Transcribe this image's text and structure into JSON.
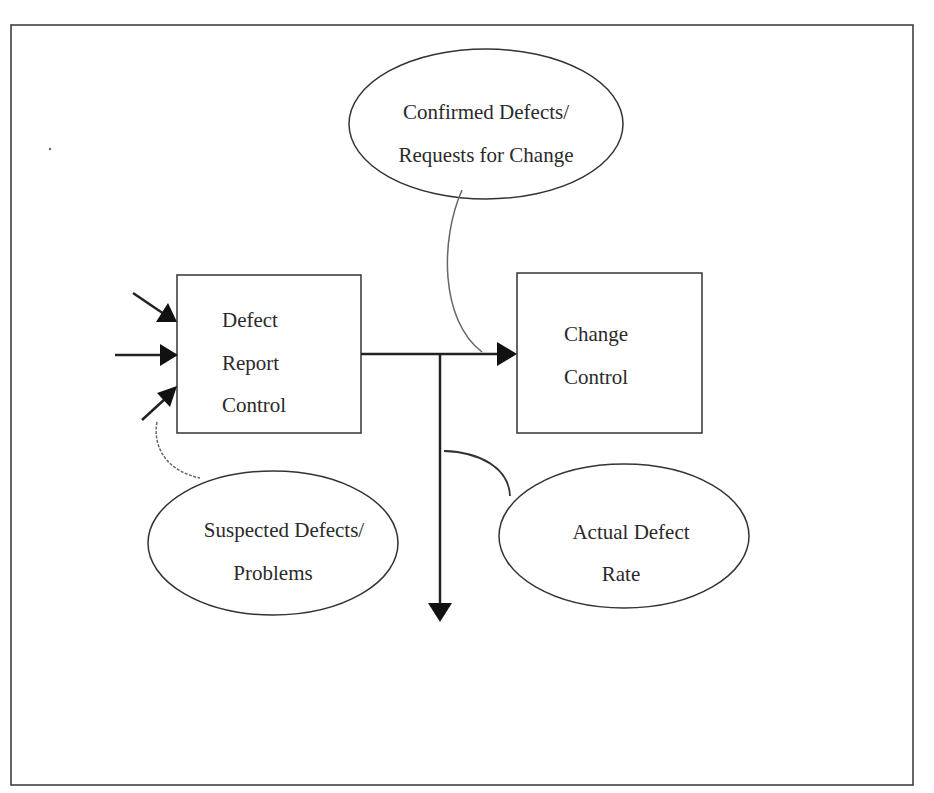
{
  "diagram": {
    "nodes": {
      "defect_report_control": {
        "lines": [
          "Defect",
          "Report",
          "Control"
        ],
        "shape": "rectangle"
      },
      "change_control": {
        "lines": [
          "Change",
          "Control"
        ],
        "shape": "rectangle"
      },
      "confirmed_defects": {
        "lines": [
          "Confirmed Defects/",
          "Requests for Change"
        ],
        "shape": "ellipse"
      },
      "suspected_defects": {
        "lines": [
          "Suspected Defects/",
          "Problems"
        ],
        "shape": "ellipse"
      },
      "actual_defect_rate": {
        "lines": [
          "Actual Defect",
          "Rate"
        ],
        "shape": "ellipse"
      }
    },
    "edges": [
      {
        "from": "external",
        "to": "defect_report_control",
        "count": 3
      },
      {
        "from": "defect_report_control",
        "to": "change_control",
        "label_ref": "confirmed_defects"
      },
      {
        "from": "defect_report_control",
        "to": "output-down",
        "label_ref": "actual_defect_rate"
      }
    ],
    "colors": {
      "stroke": "#222222",
      "connector": "#555555",
      "background": "#ffffff"
    }
  }
}
